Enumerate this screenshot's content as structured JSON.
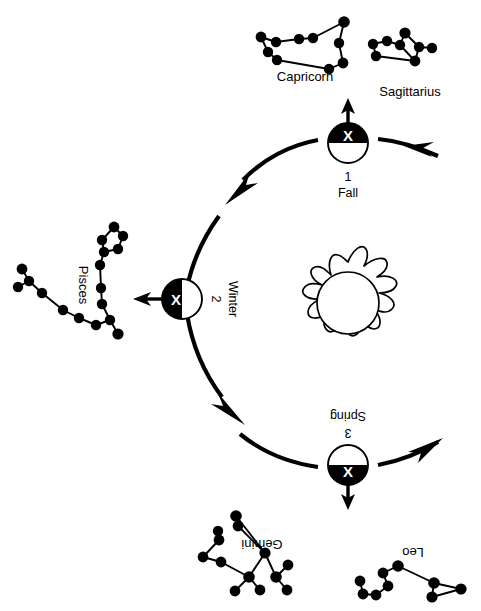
{
  "diagram": {
    "background_color": "#ffffff",
    "ink_color": "#000000",
    "orbit_direction": "counterclockwise"
  },
  "sun": {
    "name": "sun",
    "label": "",
    "center": [
      348,
      303
    ],
    "core_radius": 30,
    "ray_count": 11
  },
  "orbit": {
    "center": [
      310,
      300
    ],
    "radius": 95,
    "stroke_width": 4.2,
    "arrow_count": 3
  },
  "earth_positions": [
    {
      "id": "fall",
      "number": "1",
      "season": "Fall",
      "marker": "X",
      "shaded_half": "top",
      "center": [
        348,
        143
      ],
      "radius": 20,
      "pointer_direction": "up",
      "label_rotation": 0
    },
    {
      "id": "winter",
      "number": "2",
      "season": "Winter",
      "marker": "X",
      "shaded_half": "left",
      "center": [
        182,
        299
      ],
      "radius": 20,
      "pointer_direction": "left",
      "label_rotation": 90
    },
    {
      "id": "spring",
      "number": "3",
      "season": "Spring",
      "marker": "X",
      "shaded_half": "bottom",
      "center": [
        348,
        465
      ],
      "radius": 20,
      "pointer_direction": "down",
      "label_rotation": 180
    }
  ],
  "constellations": [
    {
      "id": "capricorn",
      "label": "Capricorn",
      "label_position": [
        305,
        78
      ],
      "label_rotation": 0,
      "seen_from": "fall"
    },
    {
      "id": "sagittarius",
      "label": "Sagittarius",
      "label_position": [
        415,
        94
      ],
      "label_rotation": 0,
      "seen_from": "fall"
    },
    {
      "id": "pisces",
      "label": "Pisces",
      "label_position": [
        80,
        288
      ],
      "label_rotation": 90,
      "seen_from": "winter"
    },
    {
      "id": "gemini",
      "label": "Gemini",
      "label_position": [
        258,
        545
      ],
      "label_rotation": 180,
      "seen_from": "spring"
    },
    {
      "id": "leo",
      "label": "Leo",
      "label_position": [
        412,
        548
      ],
      "label_rotation": 180,
      "seen_from": "spring"
    }
  ]
}
